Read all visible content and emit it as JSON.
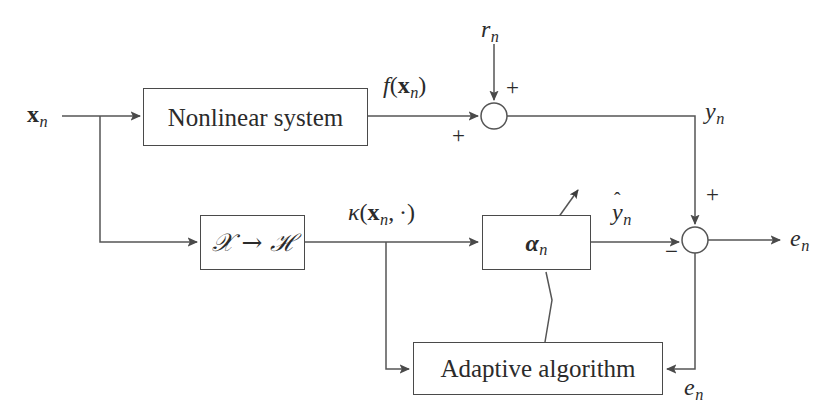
{
  "diagram": {
    "background_color": "#ffffff",
    "line_color": "#555555",
    "text_color": "#2b2b2b",
    "blocks": [
      {
        "id": "nonlinear_system",
        "label": "Nonlinear system"
      },
      {
        "id": "mapping",
        "label": "X -> H"
      },
      {
        "id": "alpha",
        "label": "alpha_n"
      },
      {
        "id": "adaptive_algorithm",
        "label": "Adaptive algorithm"
      }
    ],
    "signal_labels": {
      "input": "x_n",
      "reference_noise": "r_n",
      "system_output": "f(x_n)",
      "desired": "y_n",
      "feature_map": "kappa(x_n, .)",
      "estimate": "y_hat_n",
      "error": "e_n",
      "error_feedback": "e_n"
    },
    "signs": {
      "sum1_top": "+",
      "sum1_left": "+",
      "sum2_top": "+",
      "sum2_bottom": "−"
    },
    "junctions": [
      {
        "id": "sum-1",
        "cx": 494,
        "cy": 116,
        "r": 13
      },
      {
        "id": "sum-2",
        "cx": 695,
        "cy": 240,
        "r": 13
      }
    ]
  }
}
